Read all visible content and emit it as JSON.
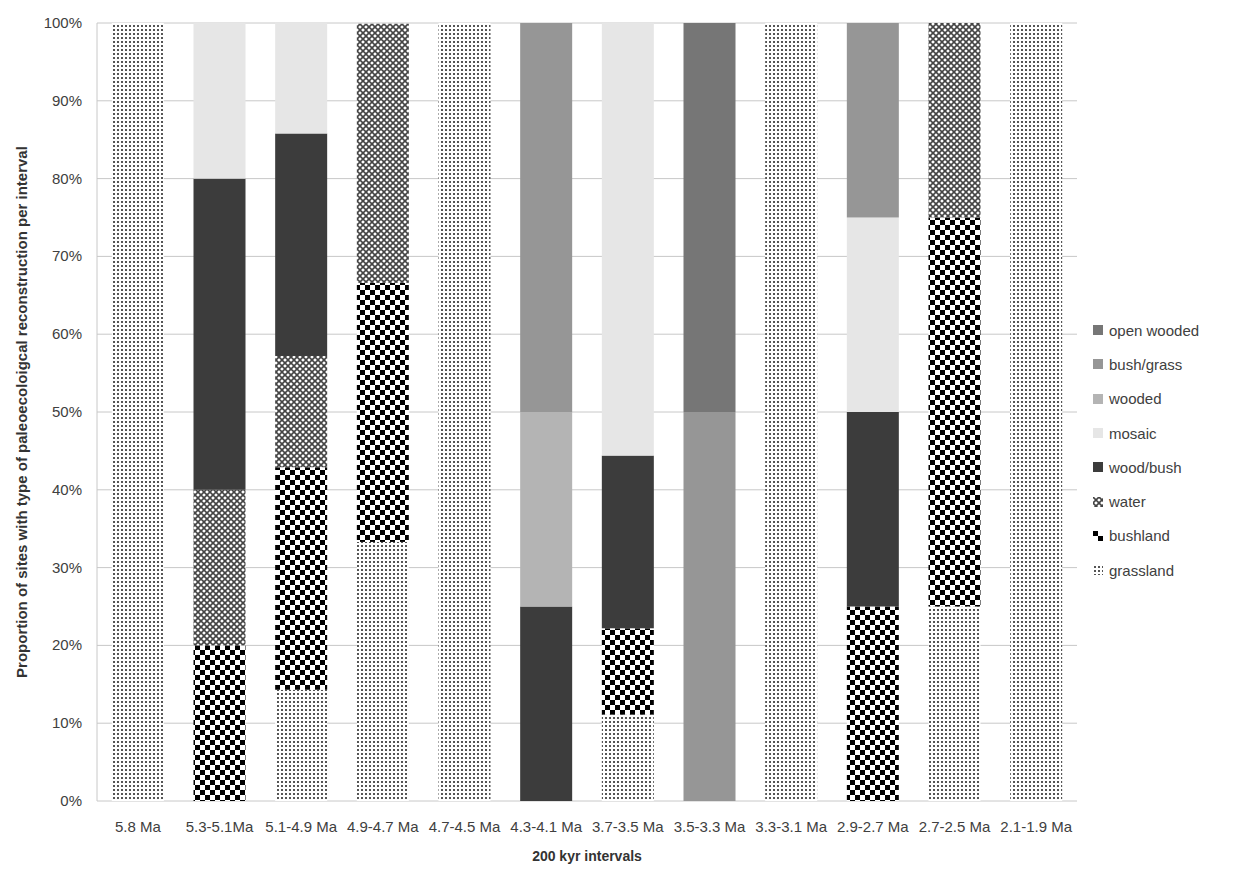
{
  "chart_data": {
    "type": "bar",
    "stacked": true,
    "percent_stacked": true,
    "title": "",
    "xlabel": "200 kyr intervals",
    "ylabel": "Proportion of sites with type of paleoecoloigcal reconstruction per interval",
    "ylim": [
      0,
      100
    ],
    "yticks": [
      "0%",
      "10%",
      "20%",
      "30%",
      "40%",
      "50%",
      "60%",
      "70%",
      "80%",
      "90%",
      "100%"
    ],
    "grid": "horizontal",
    "legend_position": "right",
    "categories": [
      "5.8 Ma",
      "5.3-5.1Ma",
      "5.1-4.9 Ma",
      "4.9-4.7 Ma",
      "4.7-4.5 Ma",
      "4.3-4.1 Ma",
      "3.7-3.5 Ma",
      "3.5-3.3 Ma",
      "3.3-3.1 Ma",
      "2.9-2.7 Ma",
      "2.7-2.5 Ma",
      "2.1-1.9 Ma"
    ],
    "series": [
      {
        "name": "grassland",
        "pattern": "dots",
        "values": [
          100,
          0,
          14.3,
          33.3,
          100,
          0,
          11.1,
          0,
          100,
          0,
          25,
          100
        ]
      },
      {
        "name": "bushland",
        "pattern": "checker",
        "values": [
          0,
          20,
          28.6,
          33.3,
          0,
          0,
          11.1,
          0,
          0,
          25,
          50,
          0
        ]
      },
      {
        "name": "water",
        "pattern": "diamond-mesh",
        "values": [
          0,
          20,
          14.3,
          33.3,
          0,
          0,
          0,
          0,
          0,
          0,
          25,
          0
        ]
      },
      {
        "name": "wood/bush",
        "pattern": "solid",
        "color": "#3c3c3c",
        "values": [
          0,
          40,
          28.6,
          0,
          0,
          25,
          22.2,
          0,
          0,
          25,
          0,
          0
        ]
      },
      {
        "name": "mosaic",
        "pattern": "solid",
        "color": "#e6e6e6",
        "values": [
          0,
          20,
          14.3,
          0,
          0,
          0,
          55.6,
          0,
          0,
          25,
          0,
          0
        ]
      },
      {
        "name": "wooded",
        "pattern": "solid",
        "color": "#b4b4b4",
        "values": [
          0,
          0,
          0,
          0,
          0,
          25,
          0,
          0,
          0,
          0,
          0,
          0
        ]
      },
      {
        "name": "bush/grass",
        "pattern": "solid",
        "color": "#969696",
        "values": [
          0,
          0,
          0,
          0,
          0,
          50,
          0,
          50,
          0,
          25,
          0,
          0
        ]
      },
      {
        "name": "open wooded",
        "pattern": "solid",
        "color": "#767676",
        "values": [
          0,
          0,
          0,
          0,
          0,
          0,
          0,
          50,
          0,
          0,
          0,
          0
        ]
      }
    ],
    "legend": [
      "open wooded",
      "bush/grass",
      "wooded",
      "mosaic",
      "wood/bush",
      "water",
      "bushland",
      "grassland"
    ]
  }
}
